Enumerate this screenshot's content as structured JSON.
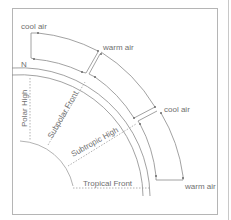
{
  "diagram": {
    "labels": {
      "cool_air_top": "cool air",
      "warm_air_mid": "warm air",
      "cool_air_right": "cool air",
      "warm_air_bottom": "warm air",
      "north": "N",
      "polar_high": "Polar High",
      "subpolar_front": "Subpolar Front",
      "subtropic_high": "Subtropic High",
      "tropical_front": "Tropical Front"
    },
    "colors": {
      "line": "#8a8a8a",
      "frame": "#b5b5b5",
      "text": "#6f6f6f",
      "background": "#ffffff"
    }
  }
}
